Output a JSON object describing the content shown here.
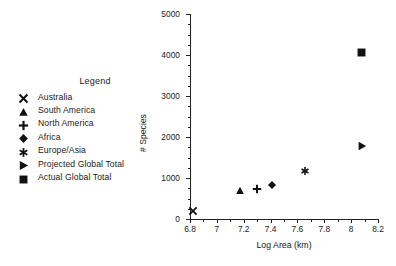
{
  "legend": {
    "title": "Legend",
    "items": [
      {
        "marker": "cross-marker",
        "label": "Australia"
      },
      {
        "marker": "triangle-up-marker",
        "label": "South America"
      },
      {
        "marker": "plus-marker",
        "label": "North America"
      },
      {
        "marker": "diamond-marker",
        "label": "Africa"
      },
      {
        "marker": "asterisk-marker",
        "label": "Europe/Asia"
      },
      {
        "marker": "triangle-right-marker",
        "label": "Projected Global Total"
      },
      {
        "marker": "square-marker",
        "label": "Actual Global Total"
      }
    ]
  },
  "chart_data": {
    "type": "scatter",
    "title": "",
    "xlabel": "Log Area (km)",
    "ylabel": "# Species",
    "xlim": [
      6.8,
      8.2
    ],
    "ylim": [
      0,
      5000
    ],
    "xticks": [
      6.8,
      7,
      7.2,
      7.4,
      7.6,
      7.8,
      8,
      8.2
    ],
    "xtick_labels": [
      "6.8",
      "7",
      "7.2",
      "7.4",
      "7.6",
      "7.8",
      "8",
      "8.2"
    ],
    "yticks": [
      0,
      1000,
      2000,
      3000,
      4000,
      5000
    ],
    "ytick_labels": [
      "0",
      "1000",
      "2000",
      "3000",
      "4000",
      "5000"
    ],
    "x_minor_ticks": [
      6.9,
      7.1,
      7.3,
      7.5,
      7.7,
      7.9,
      8.1
    ],
    "y_minor_ticks": [
      250,
      500,
      750,
      1250,
      1500,
      1750,
      2250,
      2500,
      2750,
      3250,
      3500,
      3750,
      4250,
      4500,
      4750
    ],
    "grid": false,
    "legend_position": "left-outside",
    "marker_color": "#111111",
    "points": [
      {
        "name": "Australia",
        "marker": "cross-marker",
        "x": 6.82,
        "y": 190
      },
      {
        "name": "South America",
        "marker": "triangle-up-marker",
        "x": 7.17,
        "y": 680
      },
      {
        "name": "North America",
        "marker": "plus-marker",
        "x": 7.3,
        "y": 730
      },
      {
        "name": "Africa",
        "marker": "diamond-marker",
        "x": 7.41,
        "y": 830
      },
      {
        "name": "Europe/Asia",
        "marker": "asterisk-marker",
        "x": 7.66,
        "y": 1170
      },
      {
        "name": "Projected Global Total",
        "marker": "triangle-right-marker",
        "x": 8.08,
        "y": 1770
      },
      {
        "name": "Actual Global Total",
        "marker": "square-marker",
        "x": 8.08,
        "y": 4050
      }
    ]
  }
}
